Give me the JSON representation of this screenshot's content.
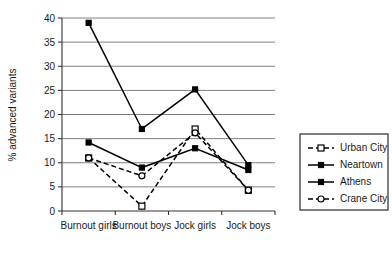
{
  "chart_data": {
    "type": "line",
    "title": "",
    "xlabel": "",
    "ylabel": "% advanced variants",
    "ylim": [
      0,
      40
    ],
    "ytick_step": 5,
    "yticks": [
      "0",
      "5",
      "10",
      "15",
      "20",
      "25",
      "30",
      "35",
      "40"
    ],
    "grid": true,
    "legend_position": "right",
    "categories": [
      "Burnout girls",
      "Burnout boys",
      "Jock girls",
      "Jock boys"
    ],
    "series": [
      {
        "name": "Urban City",
        "values": [
          11,
          1,
          17,
          4.3
        ],
        "line_style": "dashed",
        "marker": "open-square",
        "color": "#000000"
      },
      {
        "name": "Neartown",
        "values": [
          14.2,
          9,
          13,
          8.5
        ],
        "line_style": "solid",
        "marker": "filled-square",
        "color": "#000000"
      },
      {
        "name": "Athens",
        "values": [
          39,
          17,
          25.2,
          9.5
        ],
        "line_style": "solid",
        "marker": "filled-square",
        "color": "#000000"
      },
      {
        "name": "Crane City",
        "values": [
          11,
          7.3,
          16.2,
          4.3
        ],
        "line_style": "dashed",
        "marker": "open-circle",
        "color": "#000000"
      }
    ]
  },
  "axis": {
    "y_title": "% advanced variants"
  },
  "legend": {
    "items": [
      {
        "label": "Urban City"
      },
      {
        "label": "Neartown"
      },
      {
        "label": "Athens"
      },
      {
        "label": "Crane City"
      }
    ]
  }
}
